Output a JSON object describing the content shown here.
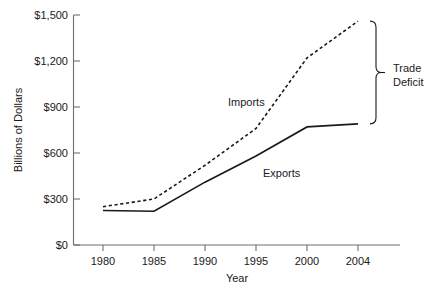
{
  "chart_data": {
    "type": "line",
    "title": "",
    "xlabel": "Year",
    "ylabel": "Billions of Dollars",
    "x": [
      1980,
      1985,
      1990,
      1995,
      2000,
      2004
    ],
    "xtick_labels": [
      "1980",
      "1985",
      "1990",
      "1995",
      "2000",
      "2004"
    ],
    "ytick_labels": [
      "$0",
      "$300",
      "$600",
      "$900",
      "$1,200",
      "$1,500"
    ],
    "ytick_values": [
      0,
      300,
      600,
      900,
      1200,
      1500
    ],
    "ylim": [
      0,
      1500
    ],
    "xlim": [
      1980,
      2004
    ],
    "grid": false,
    "legend_position": "inline-annotation",
    "series": [
      {
        "name": "Imports",
        "style": "dashed",
        "values": [
          250,
          300,
          520,
          760,
          1220,
          1460
        ]
      },
      {
        "name": "Exports",
        "style": "solid",
        "values": [
          225,
          220,
          410,
          580,
          770,
          790
        ]
      }
    ],
    "annotations": [
      {
        "name": "trade-deficit",
        "label_line1": "Trade",
        "label_line2": "Deficit",
        "type": "bracket",
        "at_x": 2004,
        "span_values": [
          790,
          1460
        ]
      }
    ]
  },
  "labels": {
    "imports": "Imports",
    "exports": "Exports",
    "trade_deficit_line1": "Trade",
    "trade_deficit_line2": "Deficit",
    "x_axis_title": "Year",
    "y_axis_title": "Billions of Dollars"
  },
  "caption": {
    "text": ""
  }
}
